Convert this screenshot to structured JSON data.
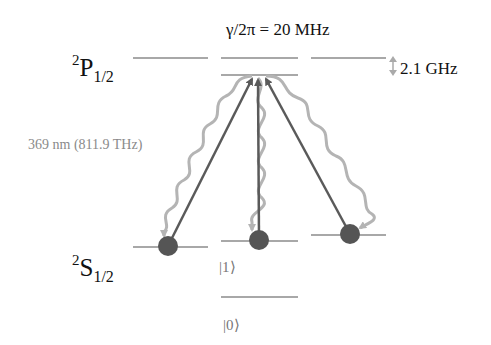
{
  "diagram": {
    "type": "energy-level-diagram",
    "excited_state": {
      "symbol": "P",
      "multiplicity": "2",
      "j": "1/2"
    },
    "ground_state": {
      "symbol": "S",
      "multiplicity": "2",
      "j": "1/2"
    },
    "linewidth_label": "γ/2π = 20 MHz",
    "excited_splitting_label": "2.1 GHz",
    "transition_label": "369 nm (811.9 THz)",
    "ket_one": "|1⟩",
    "ket_zero": "|0⟩",
    "colors": {
      "levels": "#a8a8a8",
      "excitation_arrows": "#5a5a5a",
      "decay_wavy": "#b4b4b4",
      "population": "#555555"
    }
  }
}
